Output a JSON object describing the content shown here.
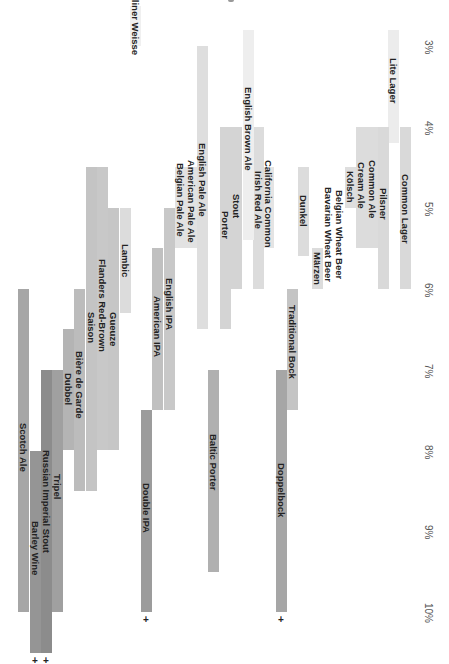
{
  "chart_data": {
    "type": "bar",
    "orientation": "rotated-90-clockwise range bars (horizontal floating bars, ABV axis runs top-to-bottom)",
    "title": "",
    "xlabel": "ABV",
    "ylabel": "",
    "x_axis": {
      "ticks": [
        "3%",
        "4%",
        "5%",
        "6%",
        "7%",
        "8%",
        "9%",
        "10%"
      ],
      "tick_values": [
        3,
        4,
        5,
        6,
        7,
        8,
        9,
        10
      ],
      "range": [
        2.5,
        10.5
      ]
    },
    "grid": false,
    "legend": null,
    "annotations": [
      "+ marks indicate ranges extending beyond 10%"
    ],
    "series": [
      {
        "name": "Lite Lager",
        "min": 2.8,
        "max": 4.2,
        "col": 388,
        "color": "#ececec"
      },
      {
        "name": "Common Lager",
        "min": 4.0,
        "max": 6.0,
        "col": 400,
        "color": "#d9d9d9"
      },
      {
        "name": "Pilsner",
        "min": 4.0,
        "max": 6.0,
        "col": 378,
        "color": "#d9d9d9"
      },
      {
        "name": "Common Ale",
        "min": 4.0,
        "max": 5.5,
        "col": 367,
        "color": "#dcdcdc"
      },
      {
        "name": "Cream Ale",
        "min": 4.0,
        "max": 5.5,
        "col": 356,
        "color": "#dcdcdc"
      },
      {
        "name": "Kölsch",
        "min": 4.5,
        "max": 5.0,
        "col": 345,
        "color": "#dedede"
      },
      {
        "name": "Belgian Wheat Beer",
        "min": null,
        "max": null,
        "col": 334,
        "color": "#dedede"
      },
      {
        "name": "Bavarian Wheat Beer",
        "min": null,
        "max": null,
        "col": 323,
        "color": "#dedede"
      },
      {
        "name": "Märzen",
        "min": 5.5,
        "max": 6.0,
        "col": 312,
        "color": "#dcdcdc"
      },
      {
        "name": "Dunkel",
        "min": 4.5,
        "max": 5.6,
        "col": 298,
        "color": "#dcdcdc"
      },
      {
        "name": "Traditional Bock",
        "min": 6.0,
        "max": 7.5,
        "col": 287,
        "color": "#c4c4c4"
      },
      {
        "name": "Doppelbock",
        "min": 7.0,
        "max": 10.0,
        "col": 276,
        "color": "#a6a6a6",
        "extends_beyond": true
      },
      {
        "name": "California Common",
        "min": 4.5,
        "max": 5.5,
        "col": 263,
        "color": "#e4e4e4"
      },
      {
        "name": "Irish Red Ale",
        "min": 4.0,
        "max": 6.0,
        "col": 253,
        "color": "#dcdcdc"
      },
      {
        "name": "English Brown Ale",
        "min": 2.8,
        "max": 5.4,
        "col": 243,
        "color": "#eeeeee"
      },
      {
        "name": "Stout",
        "min": 4.0,
        "max": 6.0,
        "col": 231,
        "color": "#d4d4d4"
      },
      {
        "name": "Porter",
        "min": 4.0,
        "max": 6.5,
        "col": 220,
        "color": "#d4d4d4"
      },
      {
        "name": "Baltic Porter",
        "min": 7.0,
        "max": 9.5,
        "col": 208,
        "color": "#b0b0b0"
      },
      {
        "name": "English Pale Ale",
        "min": 3.0,
        "max": 6.5,
        "col": 197,
        "color": "#dedede"
      },
      {
        "name": "American Pale Ale",
        "min": 4.5,
        "max": 5.5,
        "col": 186,
        "color": "#e2e2e2"
      },
      {
        "name": "Belgian Pale Ale",
        "min": 4.5,
        "max": 5.5,
        "col": 175,
        "color": "#e2e2e2"
      },
      {
        "name": "English IPA",
        "min": 5.0,
        "max": 7.5,
        "col": 164,
        "color": "#c8c8c8"
      },
      {
        "name": "American IPA",
        "min": 5.5,
        "max": 7.5,
        "col": 152,
        "color": "#c0c0c0"
      },
      {
        "name": "Double IPA",
        "min": 7.5,
        "max": 10.0,
        "col": 141,
        "color": "#9c9c9c",
        "extends_beyond": true
      },
      {
        "name": "Berliner Weisse",
        "min": 2.5,
        "max": 3.0,
        "col": 130,
        "color": "#f0f0f0"
      },
      {
        "name": "Lambic",
        "min": 5.0,
        "max": 6.3,
        "col": 120,
        "color": "#dcdcdc"
      },
      {
        "name": "Gueuze",
        "min": 5.0,
        "max": 8.0,
        "col": 108,
        "color": "#c6c6c6"
      },
      {
        "name": "Flanders Red-Brown",
        "min": 4.5,
        "max": 8.0,
        "col": 97,
        "color": "#c8c8c8"
      },
      {
        "name": "Saison",
        "min": 4.5,
        "max": 8.5,
        "col": 86,
        "color": "#c4c4c4"
      },
      {
        "name": "Bière de Garde",
        "min": 6.0,
        "max": 8.5,
        "col": 74,
        "color": "#bcbcbc"
      },
      {
        "name": "Dubbel",
        "min": 6.5,
        "max": 8.0,
        "col": 63,
        "color": "#b4b4b4"
      },
      {
        "name": "Tripel",
        "min": 7.0,
        "max": 10.0,
        "col": 52,
        "color": "#a0a0a0"
      },
      {
        "name": "Russian Imperial Stout",
        "min": 7.0,
        "max": 10.5,
        "col": 41,
        "color": "#8c8c8c",
        "extends_beyond": true
      },
      {
        "name": "Barley Wine",
        "min": 8.0,
        "max": 10.5,
        "col": 30,
        "color": "#959595",
        "extends_beyond": true
      },
      {
        "name": "Scotch Ale",
        "min": 6.0,
        "max": 10.0,
        "col": 18,
        "color": "#a6a6a6"
      }
    ]
  },
  "layout": {
    "axis_origin_y": 46,
    "px_per_percent": 80.9,
    "bar_width": 11,
    "axis_label_x": 422
  }
}
